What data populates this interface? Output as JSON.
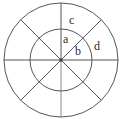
{
  "diagram": {
    "type": "concentric-circle-sector-diagram",
    "background_color": "#ffffff",
    "stroke_color": "#555555",
    "label_color": "#2b2b2b",
    "center": {
      "x": 61,
      "y": 60
    },
    "circles": [
      {
        "name": "inner-circle",
        "radius": 31
      },
      {
        "name": "outer-circle",
        "radius": 57
      }
    ],
    "spokes": {
      "count": 8,
      "angles_deg": [
        0,
        45,
        90,
        135,
        180,
        225,
        270,
        315
      ]
    },
    "labels": {
      "a": "a",
      "b": "b",
      "c": "c",
      "d": "d"
    }
  }
}
